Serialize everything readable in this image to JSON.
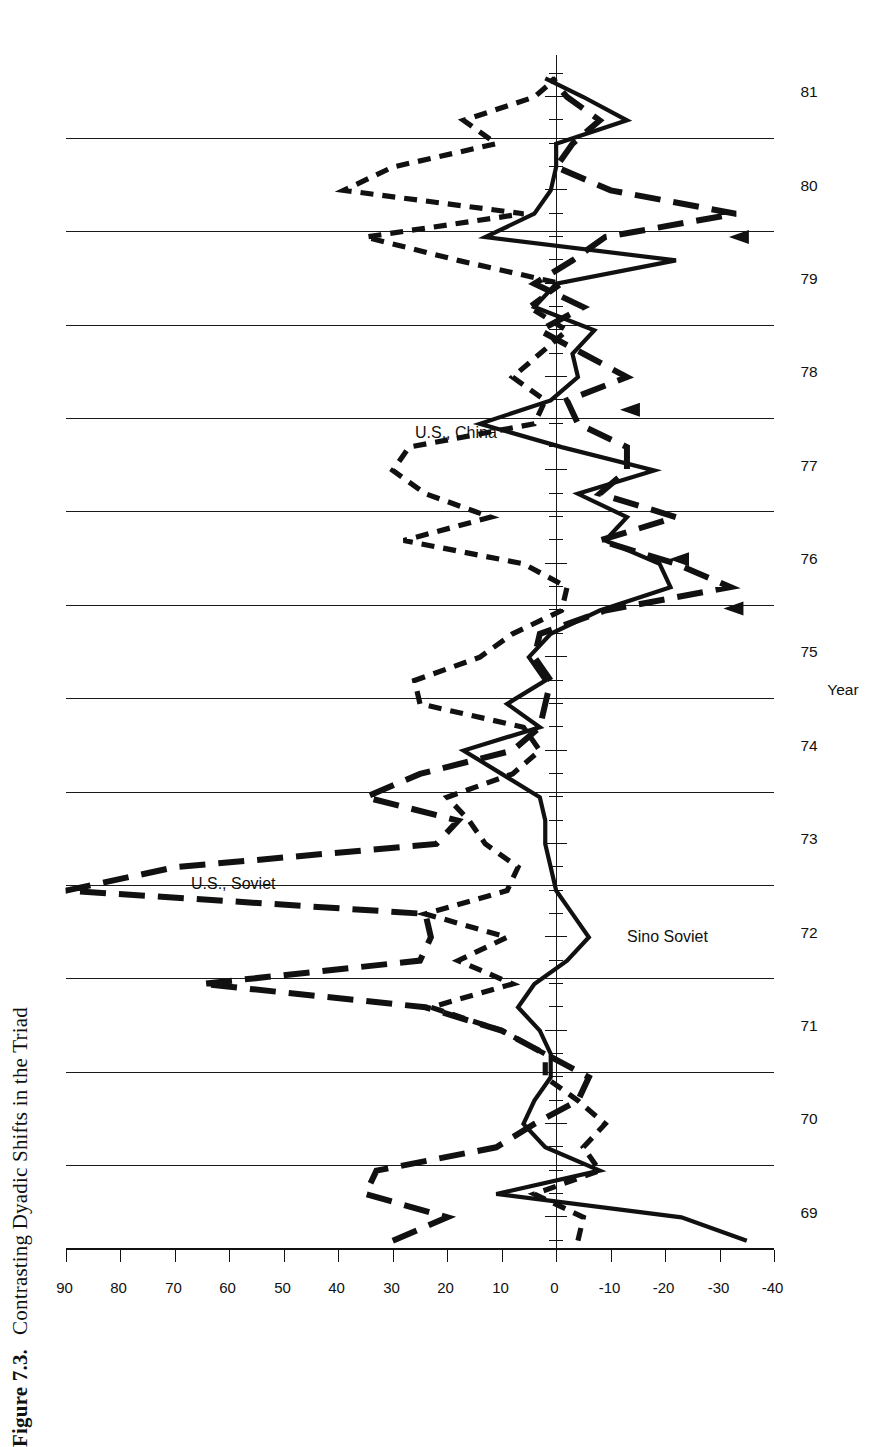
{
  "caption": {
    "number": "Figure 7.3.",
    "text": "Contrasting Dyadic Shifts in the Triad"
  },
  "chart_data": {
    "type": "line",
    "title": "Contrasting Dyadic Shifts in the Triad",
    "orientation": "rotated-90-ccw",
    "xlabel": "Year",
    "ylabel": "",
    "xlim": [
      68.6,
      81.4
    ],
    "ylim": [
      -40,
      90
    ],
    "grid": true,
    "grid_axis": "x",
    "legend": "in-plot labels",
    "xticks": [
      "69",
      "70",
      "71",
      "72",
      "73",
      "74",
      "75",
      "76",
      "77",
      "78",
      "79",
      "80",
      "81"
    ],
    "yticks": [
      "90",
      "80",
      "70",
      "60",
      "50",
      "40",
      "30",
      "20",
      "10",
      "0",
      "-10",
      "-20",
      "-30",
      "-40"
    ],
    "ytick_values": [
      90,
      80,
      70,
      60,
      50,
      40,
      30,
      20,
      10,
      0,
      -10,
      -20,
      -30,
      -40
    ],
    "series": [
      {
        "name": "Sino Soviet",
        "style": "solid",
        "label_x": 72.05,
        "label_y": -13,
        "x": [
          68.7,
          68.95,
          69.2,
          69.45,
          69.7,
          69.95,
          70.2,
          70.45,
          70.7,
          70.95,
          71.2,
          71.45,
          71.7,
          71.95,
          72.2,
          72.45,
          72.7,
          72.95,
          73.2,
          73.45,
          73.7,
          73.95,
          74.2,
          74.45,
          74.7,
          74.95,
          75.2,
          75.45,
          75.7,
          75.95,
          76.2,
          76.45,
          76.7,
          76.95,
          77.2,
          77.45,
          77.7,
          77.95,
          78.2,
          78.45,
          78.7,
          78.95,
          79.2,
          79.45,
          79.7,
          79.95,
          80.2,
          80.45,
          80.7,
          80.95,
          81.15
        ],
        "y": [
          -35,
          -23,
          11,
          -8,
          2,
          6,
          4,
          1,
          1,
          3,
          7,
          4,
          -2,
          -6,
          -3,
          0,
          1,
          2,
          2,
          3,
          10,
          17,
          3,
          9,
          2,
          5,
          1,
          -8,
          -21,
          -19,
          -9,
          -13,
          -4,
          -18,
          -1,
          14,
          1,
          -4,
          -3,
          -7,
          4,
          0,
          -22,
          13,
          4,
          1,
          0,
          0,
          -13,
          -5,
          2
        ]
      },
      {
        "name": "U.S., Soviet",
        "style": "long-dash",
        "label_x": 72.62,
        "label_y": 67,
        "arrow_points": [
          [
            75.47,
            -32
          ],
          [
            76.0,
            -22
          ],
          [
            77.6,
            -13
          ],
          [
            79.45,
            -33
          ]
        ],
        "x": [
          68.7,
          68.95,
          69.2,
          69.45,
          69.7,
          69.95,
          70.2,
          70.45,
          70.7,
          70.95,
          71.2,
          71.45,
          71.7,
          71.95,
          72.2,
          72.45,
          72.7,
          72.95,
          73.2,
          73.45,
          73.7,
          73.95,
          74.2,
          74.45,
          74.7,
          74.95,
          75.2,
          75.45,
          75.7,
          75.95,
          76.2,
          76.45,
          76.7,
          76.95,
          77.2,
          77.45,
          77.7,
          77.95,
          78.2,
          78.45,
          78.7,
          78.95,
          79.2,
          79.45,
          79.7,
          79.95,
          80.2,
          80.45,
          80.7,
          80.95,
          81.15
        ],
        "y": [
          30,
          20,
          35,
          33,
          11,
          4,
          -4,
          -6,
          2,
          10,
          24,
          65,
          25,
          23,
          24,
          90,
          70,
          22,
          18,
          35,
          25,
          8,
          3,
          2,
          1,
          4,
          3,
          -9,
          -32,
          -22,
          -8,
          -22,
          -8,
          -13,
          -13,
          -4,
          -2,
          -13,
          -5,
          3,
          -5,
          4,
          -3,
          -9,
          -33,
          -10,
          0,
          -3,
          -8,
          -2,
          1
        ]
      },
      {
        "name": "U.S., China",
        "style": "short-dash",
        "label_x": 77.45,
        "label_y": 26,
        "x": [
          68.7,
          68.95,
          69.2,
          69.45,
          69.7,
          69.95,
          70.2,
          70.45,
          70.7,
          70.95,
          71.2,
          71.45,
          71.7,
          71.95,
          72.2,
          72.45,
          72.7,
          72.95,
          73.2,
          73.45,
          73.7,
          73.95,
          74.2,
          74.45,
          74.7,
          74.95,
          75.2,
          75.45,
          75.7,
          75.95,
          76.2,
          76.45,
          76.7,
          76.95,
          77.2,
          77.45,
          77.7,
          77.95,
          78.2,
          78.45,
          78.7,
          78.95,
          79.2,
          79.45,
          79.7,
          79.95,
          80.2,
          80.45,
          80.7,
          80.95,
          81.15
        ],
        "y": [
          -4,
          -5,
          4,
          -8,
          -5,
          -9,
          -4,
          2,
          2,
          10,
          23,
          8,
          18,
          9,
          24,
          9,
          7,
          13,
          16,
          20,
          8,
          3,
          6,
          25,
          26,
          14,
          8,
          -1,
          -2,
          6,
          28,
          12,
          24,
          30,
          27,
          4,
          2,
          8,
          3,
          -2,
          5,
          -1,
          18,
          35,
          6,
          39,
          30,
          11,
          17,
          4,
          0
        ]
      }
    ]
  }
}
